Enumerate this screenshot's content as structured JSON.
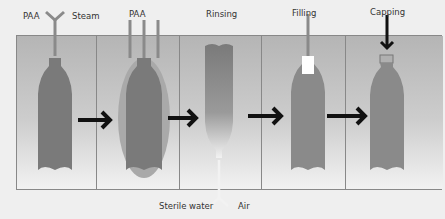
{
  "steps": [
    {
      "id": "sterilization",
      "inputs": [
        "PAA",
        "Steam"
      ]
    },
    {
      "id": "paa-treatment",
      "inputs": [
        "PAA"
      ]
    },
    {
      "id": "rinsing",
      "label": "Rinsing",
      "inputs": [
        "Sterile water",
        "Air"
      ]
    },
    {
      "id": "filling",
      "label": "Filling"
    },
    {
      "id": "capping",
      "label": "Capping"
    }
  ],
  "labels": {
    "paa1": "PAA",
    "steam": "Steam",
    "paa2": "PAA",
    "rinsing": "Rinsing",
    "filling": "Filling",
    "capping": "Capping",
    "sterile_water": "Sterile water",
    "air": "Air"
  },
  "colors": {
    "bottle": "#7a7a7a",
    "halo": "#a9a9a9",
    "arrow": "#111111",
    "panel_top": "#b5b5b5",
    "panel_bottom": "#f2f2f2"
  }
}
